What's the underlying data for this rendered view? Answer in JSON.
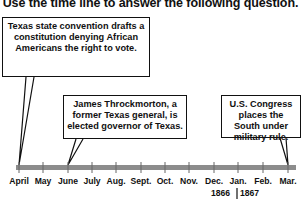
{
  "title": "Use the time line to answer the following question.",
  "events": [
    {
      "text": "Texas state convention drafts a constitution denying African Americans the right to vote.",
      "month": "April"
    },
    {
      "text": "James Throckmorton, a former Texas general, is elected governor of Texas.",
      "month": "June"
    },
    {
      "text": "U.S. Congress places the South under military rule.",
      "month": "Mar."
    }
  ],
  "timeline": {
    "months": [
      "April",
      "May",
      "June",
      "July",
      "Aug.",
      "Sept.",
      "Oct.",
      "Nov.",
      "Dec.",
      "Jan.",
      "Feb.",
      "Mar."
    ],
    "years": [
      "1866",
      "1867"
    ],
    "bar_color": "#8c8c8c"
  }
}
